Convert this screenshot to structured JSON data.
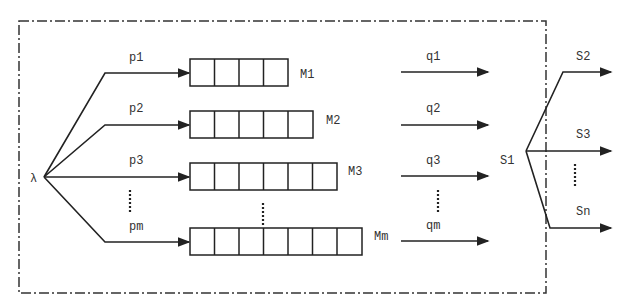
{
  "diagram": {
    "source_label": "λ",
    "server_label": "S1",
    "routing_probs": [
      "p1",
      "p2",
      "p3",
      "pm"
    ],
    "queues": [
      {
        "label": "M1",
        "cells": 4
      },
      {
        "label": "M2",
        "cells": 5
      },
      {
        "label": "M3",
        "cells": 6
      },
      {
        "label": "Mm",
        "cells": 7
      }
    ],
    "outflows": [
      "q1",
      "q2",
      "q3",
      "qm"
    ],
    "downstream": [
      "S2",
      "S3",
      "Sn"
    ],
    "ellipsis": "⋮"
  }
}
